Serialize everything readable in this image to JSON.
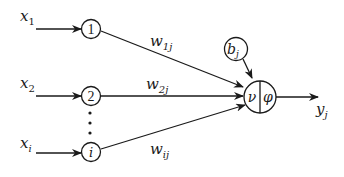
{
  "diagram": {
    "type": "single-neuron-model",
    "inputs": [
      {
        "label": "x",
        "sub": "1",
        "node": "1",
        "weight": "w",
        "weight_sub": "1j"
      },
      {
        "label": "x",
        "sub": "2",
        "node": "2",
        "weight": "w",
        "weight_sub": "2j"
      },
      {
        "label": "x",
        "sub": "i",
        "node": "i",
        "weight": "w",
        "weight_sub": "ij"
      }
    ],
    "ellipsis": "⋮",
    "bias": {
      "label": "b",
      "sub": "j"
    },
    "neuron": {
      "sum_label": "ν",
      "activation_label": "φ"
    },
    "output": {
      "label": "y",
      "sub": "j"
    },
    "colors": {
      "stroke": "#1a1a1a",
      "background": "#ffffff"
    }
  }
}
